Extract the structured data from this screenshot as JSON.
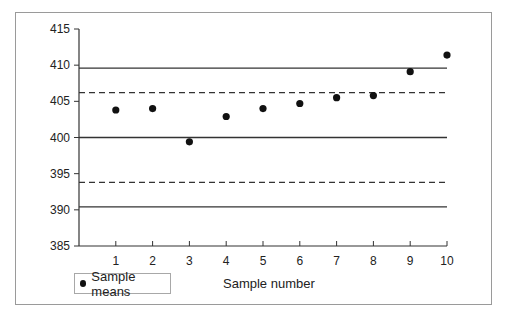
{
  "chart_data": {
    "type": "scatter",
    "title": "",
    "xlabel": "Sample number",
    "ylabel": "",
    "xlim": [
      0,
      10
    ],
    "ylim": [
      385,
      415
    ],
    "x_ticks": [
      1,
      2,
      3,
      4,
      5,
      6,
      7,
      8,
      9,
      10
    ],
    "y_ticks": [
      385,
      390,
      395,
      400,
      405,
      410,
      415
    ],
    "grid": false,
    "legend": {
      "position": "bottom-left",
      "entries": [
        "Sample means"
      ]
    },
    "series": [
      {
        "name": "Sample means",
        "x": [
          1,
          2,
          3,
          4,
          5,
          6,
          7,
          8,
          9,
          10
        ],
        "values": [
          403.8,
          404.0,
          399.4,
          402.9,
          404.0,
          404.7,
          405.5,
          405.8,
          409.1,
          411.4
        ]
      }
    ],
    "reference_lines": [
      {
        "name": "upper control limit",
        "y": 409.6,
        "style": "solid"
      },
      {
        "name": "upper warning limit",
        "y": 406.2,
        "style": "dashed"
      },
      {
        "name": "center line",
        "y": 400,
        "style": "solid"
      },
      {
        "name": "lower warning limit",
        "y": 393.8,
        "style": "dashed"
      },
      {
        "name": "lower control limit",
        "y": 390.4,
        "style": "solid"
      }
    ]
  },
  "legend": {
    "label": "Sample means"
  },
  "axis": {
    "x_title": "Sample number"
  },
  "colors": {
    "frame": "#9a9a9a",
    "lines": "#333333",
    "points": "#111111"
  }
}
